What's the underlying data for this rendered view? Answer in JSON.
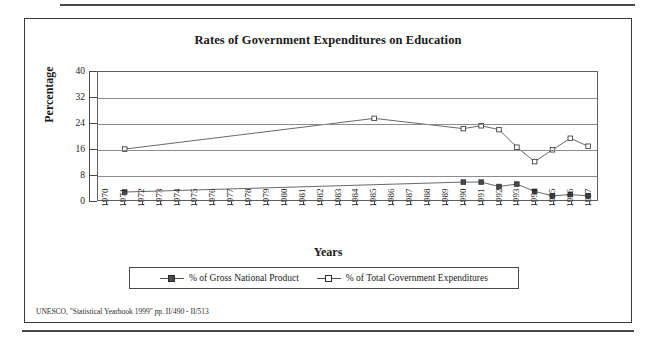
{
  "figure": {
    "title": "Rates of Government Expenditures on Education",
    "source_note": "UNESCO, \"Statistical Yearbook 1999\" pp. II/490 - II/513"
  },
  "axes": {
    "x_title": "Years",
    "y_title": "Percentage",
    "y_ticks": [
      "40",
      "32",
      "24",
      "16",
      "8",
      "0"
    ]
  },
  "legend": {
    "items": [
      {
        "label": "% of Gross National Product",
        "marker": "filled-square-marker",
        "color": "#4a4a4a"
      },
      {
        "label": "% of Total Government Expenditures",
        "marker": "open-square-marker",
        "color": "#ffffff"
      }
    ]
  },
  "chart_data": {
    "type": "line",
    "title": "Rates of Government Expenditures on Education",
    "xlabel": "Years",
    "ylabel": "Percentage",
    "ylim": [
      0,
      40
    ],
    "yticks": [
      0,
      8,
      16,
      24,
      32,
      40
    ],
    "grid": true,
    "legend_position": "bottom",
    "categories": [
      "1970",
      "1971",
      "1972",
      "1973",
      "1974",
      "1975",
      "1976",
      "1977",
      "1978",
      "1979",
      "1980",
      "1981",
      "1982",
      "1983",
      "1984",
      "1985",
      "1986",
      "1987",
      "1988",
      "1989",
      "1990",
      "1991",
      "1992",
      "1993",
      "1994",
      "1995",
      "1996",
      "1997"
    ],
    "series": [
      {
        "name": "% of Gross National Product",
        "marker": "filled-square",
        "color": "#4a4a4a",
        "x": [
          "1971",
          "1990",
          "1991",
          "1992",
          "1993",
          "1994",
          "1995",
          "1996",
          "1997"
        ],
        "values": [
          2.5,
          5.6,
          5.6,
          4.2,
          5.0,
          2.7,
          1.3,
          1.7,
          1.3
        ]
      },
      {
        "name": "% of Total Government Expenditures",
        "marker": "open-square",
        "color": "#ffffff",
        "x": [
          "1971",
          "1985",
          "1990",
          "1991",
          "1992",
          "1993",
          "1994",
          "1995",
          "1996",
          "1997"
        ],
        "values": [
          15.9,
          25.5,
          22.3,
          23.2,
          22.0,
          16.5,
          12.0,
          15.7,
          19.3,
          16.8
        ]
      }
    ]
  }
}
